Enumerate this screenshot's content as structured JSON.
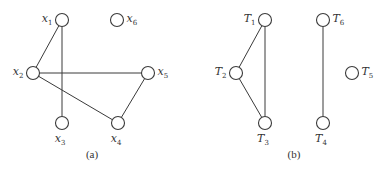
{
  "diagrams": [
    {
      "caption": "(a)",
      "caption_pos": [
        92,
        158
      ],
      "nodes": [
        {
          "id": "x1",
          "base": "x",
          "sub": "1",
          "cx": 62,
          "cy": 20,
          "label_side": "left"
        },
        {
          "id": "x2",
          "base": "x",
          "sub": "2",
          "cx": 33,
          "cy": 73,
          "label_side": "left"
        },
        {
          "id": "x3",
          "base": "x",
          "sub": "3",
          "cx": 62,
          "cy": 123,
          "label_side": "below"
        },
        {
          "id": "x4",
          "base": "x",
          "sub": "4",
          "cx": 118,
          "cy": 123,
          "label_side": "below"
        },
        {
          "id": "x5",
          "base": "x",
          "sub": "5",
          "cx": 148,
          "cy": 73,
          "label_side": "right"
        },
        {
          "id": "x6",
          "base": "x",
          "sub": "6",
          "cx": 117,
          "cy": 20,
          "label_side": "right"
        }
      ],
      "edges": [
        [
          "x1",
          "x2"
        ],
        [
          "x1",
          "x3"
        ],
        [
          "x2",
          "x5"
        ],
        [
          "x2",
          "x4"
        ],
        [
          "x4",
          "x5"
        ]
      ]
    },
    {
      "caption": "(b)",
      "caption_pos": [
        294,
        158
      ],
      "nodes": [
        {
          "id": "T1",
          "base": "T",
          "sub": "1",
          "cx": 265,
          "cy": 20,
          "label_side": "left"
        },
        {
          "id": "T2",
          "base": "T",
          "sub": "2",
          "cx": 236,
          "cy": 73,
          "label_side": "left"
        },
        {
          "id": "T3",
          "base": "T",
          "sub": "3",
          "cx": 265,
          "cy": 123,
          "label_side": "below"
        },
        {
          "id": "T4",
          "base": "T",
          "sub": "4",
          "cx": 323,
          "cy": 123,
          "label_side": "below"
        },
        {
          "id": "T5",
          "base": "T",
          "sub": "5",
          "cx": 352,
          "cy": 73,
          "label_side": "right"
        },
        {
          "id": "T6",
          "base": "T",
          "sub": "6",
          "cx": 323,
          "cy": 20,
          "label_side": "right"
        }
      ],
      "edges": [
        [
          "T1",
          "T2"
        ],
        [
          "T1",
          "T3"
        ],
        [
          "T2",
          "T3"
        ],
        [
          "T6",
          "T4"
        ]
      ]
    }
  ],
  "style": {
    "node_radius": 6.5,
    "stroke_color": "#3a3a3a"
  }
}
